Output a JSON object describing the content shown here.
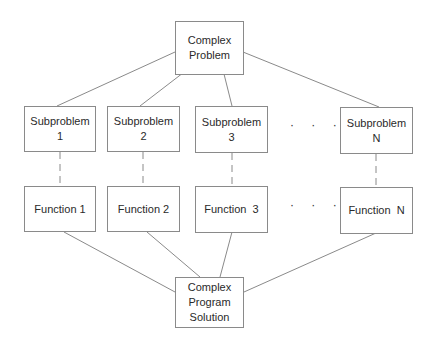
{
  "diagram": {
    "top": {
      "line1": "Complex",
      "line2": "Problem"
    },
    "subproblems": [
      {
        "label": "Subproblem",
        "index": "1"
      },
      {
        "label": "Subproblem",
        "index": "2"
      },
      {
        "label": "Subproblem",
        "index": "3"
      },
      {
        "label": "Subproblem",
        "index": "N"
      }
    ],
    "functions": [
      {
        "label": "Function 1"
      },
      {
        "label": "Function 2"
      },
      {
        "label": "Function  3"
      },
      {
        "label": "Function  N"
      }
    ],
    "ellipsis": "· · ·",
    "bottom": {
      "line1": "Complex",
      "line2": "Program",
      "line3": "Solution"
    },
    "colors": {
      "line": "#8a8a8a",
      "border": "#8a8a8a",
      "text": "#2a2a2a"
    }
  }
}
